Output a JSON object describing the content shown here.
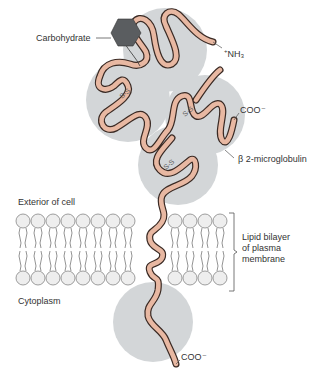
{
  "labels": {
    "carbohydrate": "Carbohydrate",
    "nh3": "NH₃",
    "nh3_charge": "+",
    "coo_top": "COO⁻",
    "beta2": "β 2-microglobulin",
    "exterior": "Exterior of cell",
    "lipid_bilayer_line1": "Lipid bilayer",
    "lipid_bilayer_line2": "of plasma",
    "lipid_bilayer_line3": "membrane",
    "cytoplasm": "Cytoplasm",
    "coo_bottom": "COO⁻",
    "disulfide": "S-S"
  },
  "colors": {
    "domain_fill": "#d3d6d8",
    "chain_fill": "#e8b8a2",
    "chain_outline": "#3a2a24",
    "carbohydrate_fill": "#5a5d60",
    "lipid_head_fill": "#eeeeee",
    "lipid_outline": "#777777",
    "text": "#333333"
  }
}
